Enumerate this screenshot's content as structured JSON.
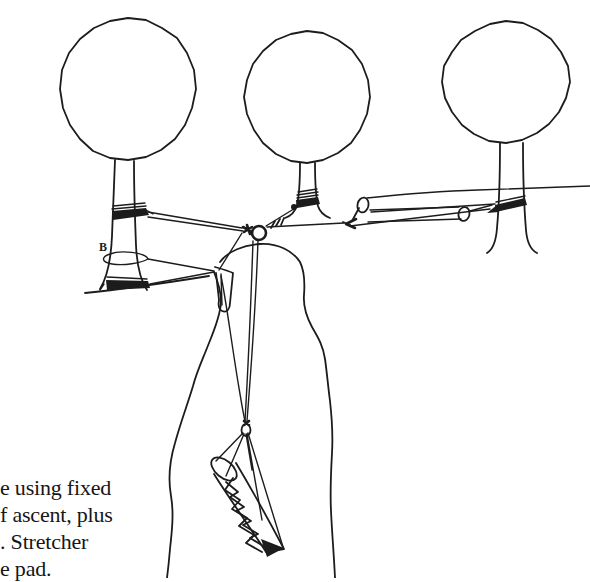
{
  "figure": {
    "label_b": "B",
    "ink_color": "#1c1c1c",
    "paper_color": "#ffffff",
    "elements": [
      "three-trees-with-anchor-slings",
      "anchor-ring-pulley",
      "haul-rollers-to-right-tree",
      "cliff-edge-pad",
      "lowering-ropes",
      "stretcher-on-cliff-face"
    ]
  },
  "caption": {
    "lines": [
      "e using fixed",
      "f ascent, plus",
      ". Stretcher",
      "e pad."
    ]
  }
}
